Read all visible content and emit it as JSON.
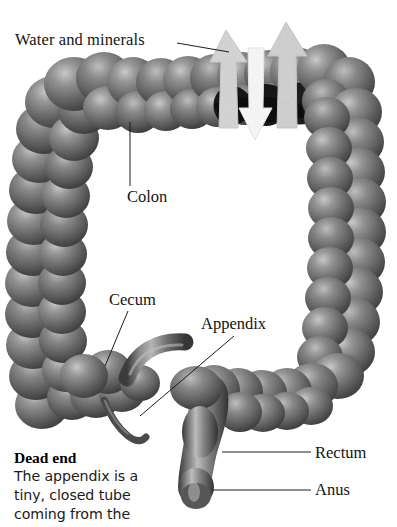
{
  "figure": {
    "background_color": "#ffffff",
    "ink_color": "#141414"
  },
  "labels": {
    "water_and_minerals": "Water and minerals",
    "colon": "Colon",
    "cecum": "Cecum",
    "appendix": "Appendix",
    "rectum": "Rectum",
    "anus": "Anus"
  },
  "caption": {
    "title": "Dead end",
    "lines": [
      "The appendix is a",
      "tiny, closed tube",
      "coming from the"
    ]
  },
  "arrows": {
    "up_left": "absorption-arrow-up-left",
    "down_middle": "secretion-arrow-down-middle",
    "up_right": "absorption-arrow-up-right",
    "up_color": "#d7d7d7",
    "down_color": "#fbfbfb"
  },
  "anatomy": {
    "ascending_colon": "ascending-colon",
    "transverse_colon": "transverse-colon",
    "descending_colon": "descending-colon",
    "sigmoid_colon": "sigmoid-colon",
    "cecum": "cecum",
    "ileum": "ileum",
    "appendix": "appendix",
    "rectum": "rectum",
    "anus": "anus",
    "cutaway": "colon-cutaway-lumen",
    "tissue_dark": "#4a4a4a",
    "tissue_mid": "#6e6e6e",
    "tissue_light": "#a9a9a9",
    "lumen_color": "#1b1b1b"
  }
}
